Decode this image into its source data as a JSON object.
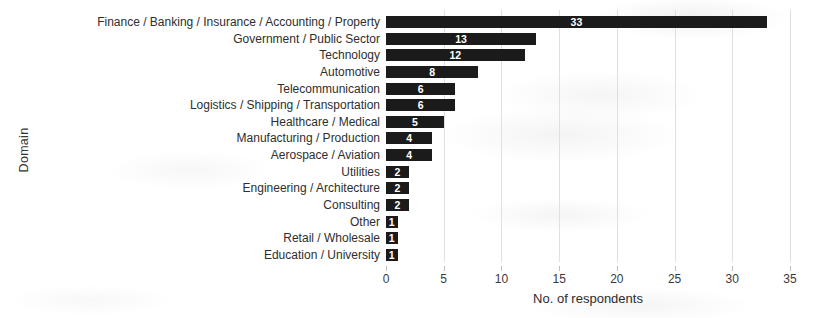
{
  "chart_data": {
    "type": "bar",
    "orientation": "horizontal",
    "title": "",
    "xlabel": "No. of respondents",
    "ylabel": "Domain",
    "categories": [
      "Finance / Banking / Insurance / Accounting / Property",
      "Government / Public Sector",
      "Technology",
      "Automotive",
      "Telecommunication",
      "Logistics / Shipping / Transportation",
      "Healthcare / Medical",
      "Manufacturing / Production",
      "Aerospace / Aviation",
      "Utilities",
      "Engineering / Architecture",
      "Consulting",
      "Other",
      "Retail / Wholesale",
      "Education / University"
    ],
    "values": [
      33,
      13,
      12,
      8,
      6,
      6,
      5,
      4,
      4,
      2,
      2,
      2,
      1,
      1,
      1
    ],
    "xlim": [
      0,
      35
    ],
    "xticks": [
      0,
      5,
      10,
      15,
      20,
      25,
      30,
      35
    ],
    "grid": "vertical-light",
    "legend": "none",
    "bar_color": "#1b1b1b",
    "value_label_color": "#ffffff",
    "value_labels_shown": true
  }
}
